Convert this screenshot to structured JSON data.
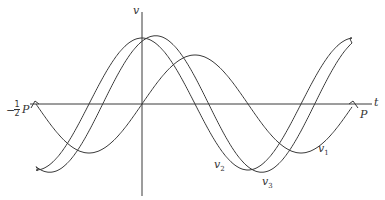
{
  "diagram": {
    "axes": {
      "vertical_label": "v",
      "horizontal_label": "t",
      "left_marker": {
        "prefix": "−",
        "frac_num": "1",
        "frac_den": "2",
        "symbol": "P"
      },
      "right_marker": "P"
    },
    "curves": [
      {
        "id": "v1",
        "label": "v",
        "subscript": "1"
      },
      {
        "id": "v2",
        "label": "v",
        "subscript": "2"
      },
      {
        "id": "v3",
        "label": "v",
        "subscript": "3"
      }
    ],
    "colors": {
      "stroke": "#3a3a3a",
      "background": "#ffffff"
    }
  }
}
